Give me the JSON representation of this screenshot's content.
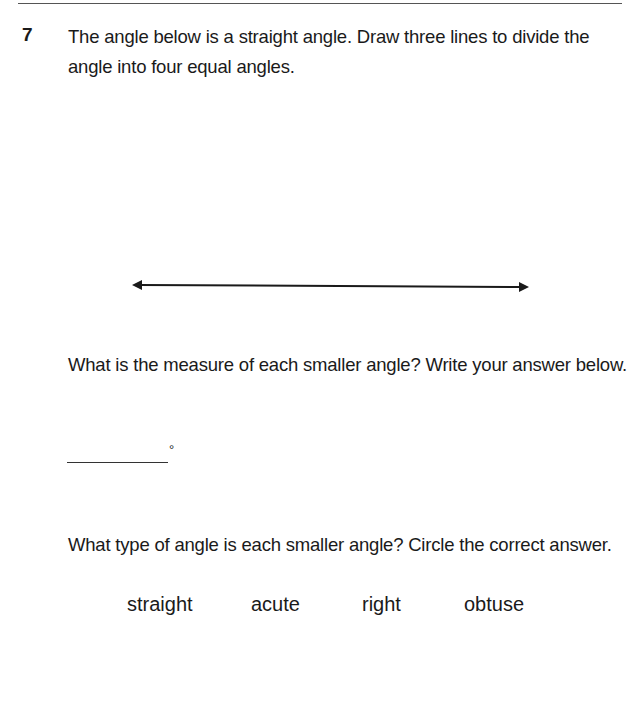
{
  "question": {
    "number": "7",
    "prompt": "The angle below is a straight angle. Draw three lines to divide the angle into four equal angles.",
    "sub_question_1": "What is the measure of each smaller angle? Write your answer below.",
    "answer_unit": "°",
    "sub_question_2": "What type of angle is each smaller angle? Circle the correct answer.",
    "options": [
      "straight",
      "acute",
      "right",
      "obtuse"
    ]
  },
  "figure": {
    "type": "double-headed-arrow-line",
    "color": "#1a1a1a"
  }
}
